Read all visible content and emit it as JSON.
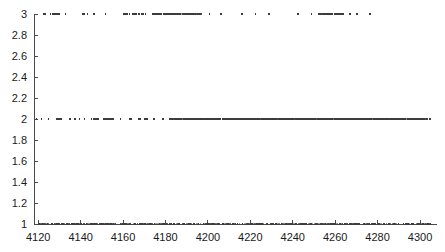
{
  "chart_data": {
    "type": "scatter",
    "title": "",
    "subtitle": "",
    "xlabel": "",
    "ylabel": "",
    "xlim": [
      4118,
      4308
    ],
    "ylim": [
      1,
      3
    ],
    "grid": false,
    "legend": null,
    "x_ticks": [
      4120,
      4140,
      4160,
      4180,
      4200,
      4220,
      4240,
      4260,
      4280,
      4300
    ],
    "x_tick_labels": [
      "4120",
      "4140",
      "4160",
      "4180",
      "4200",
      "4220",
      "4240",
      "4260",
      "4280",
      "4300"
    ],
    "y_ticks": [
      1,
      1.2,
      1.4,
      1.6,
      1.8,
      2,
      2.2,
      2.4,
      2.6,
      2.8,
      3
    ],
    "y_tick_labels": [
      "1",
      "1.2",
      "1.4",
      "1.6",
      "1.8",
      "2",
      "2.2",
      "2.4",
      "2.6",
      "2.8",
      "3"
    ],
    "marker": "dot",
    "marker_size": 1.6,
    "marker_color": "#3c3c3c",
    "axis_color": "#4a4a4a",
    "background_color": "#ffffff",
    "series": [
      {
        "name": "level-3",
        "y": 3,
        "x": [
          4122.4,
          4123.1,
          4125.8,
          4127.0,
          4127.6,
          4128.2,
          4128.9,
          4129.5,
          4130.1,
          4132.9,
          4141.0,
          4141.7,
          4143.2,
          4146.4,
          4151.8,
          4160.2,
          4161.0,
          4161.8,
          4163.1,
          4164.4,
          4165.2,
          4166.0,
          4167.5,
          4168.9,
          4169.7,
          4170.6,
          4174.2,
          4175.0,
          4175.8,
          4176.6,
          4177.4,
          4178.2,
          4179.0,
          4179.8,
          4180.6,
          4181.4,
          4182.2,
          4183.0,
          4183.8,
          4184.6,
          4185.4,
          4186.8,
          4188.0,
          4189.2,
          4190.0,
          4190.8,
          4191.6,
          4192.4,
          4193.2,
          4194.0,
          4195.2,
          4196.5,
          4200.8,
          4206.3,
          4216.1,
          4222.4,
          4228.8,
          4242.6,
          4248.9,
          4252.3,
          4253.1,
          4254.0,
          4254.8,
          4255.6,
          4256.4,
          4257.2,
          4258.0,
          4258.8,
          4259.6,
          4260.4,
          4261.2,
          4262.0,
          4262.8,
          4263.6,
          4266.9,
          4270.2,
          4276.5
        ],
        "count": 77
      },
      {
        "name": "level-2",
        "y": 2,
        "x": [
          4119.2,
          4121.5,
          4124.8,
          4128.6,
          4129.4,
          4130.2,
          4131.0,
          4134.9,
          4137.2,
          4139.5,
          4141.8,
          4145.1,
          4146.0,
          4146.8,
          4147.6,
          4148.4,
          4150.7,
          4151.5,
          4152.3,
          4153.1,
          4153.9,
          4154.7,
          4155.5,
          4158.8,
          4163.2,
          4164.0,
          4167.3,
          4168.1,
          4170.4,
          4171.2,
          4174.5,
          4178.8,
          4182.1,
          4183.0,
          4184.4,
          4185.2,
          4186.0,
          4186.8,
          4187.6,
          4188.4,
          4189.2,
          4190.0,
          4190.8,
          4191.6,
          4192.4,
          4193.2,
          4194.0,
          4194.8,
          4195.6,
          4196.4,
          4197.2,
          4198.0,
          4198.8,
          4199.6,
          4200.4,
          4201.2,
          4202.0,
          4202.8,
          4203.6,
          4204.4,
          4205.2,
          4206.0,
          4206.8,
          4207.6,
          4208.4,
          4209.2,
          4210.0,
          4210.8,
          4211.6,
          4212.4,
          4213.2,
          4214.0,
          4214.8,
          4215.6,
          4216.4,
          4217.2,
          4218.0,
          4218.8,
          4219.6,
          4220.4,
          4221.2,
          4222.0,
          4222.8,
          4223.6,
          4224.4,
          4225.2,
          4226.0,
          4226.8,
          4227.6,
          4228.4,
          4229.2,
          4230.0,
          4230.8,
          4231.6,
          4232.4,
          4233.2,
          4234.0,
          4234.8,
          4235.6,
          4236.4,
          4237.2,
          4238.0,
          4238.8,
          4239.6,
          4240.4,
          4241.2,
          4242.0,
          4242.8,
          4243.6,
          4244.4,
          4245.2,
          4246.0,
          4246.8,
          4247.6,
          4248.4,
          4249.2,
          4250.0,
          4250.8,
          4251.6,
          4252.4,
          4253.2,
          4254.0,
          4254.8,
          4255.6,
          4256.4,
          4257.2,
          4258.0,
          4258.8,
          4259.6,
          4260.4,
          4261.2,
          4262.0,
          4262.8,
          4263.6,
          4264.4,
          4265.2,
          4266.0,
          4266.8,
          4267.6,
          4268.4,
          4269.2,
          4270.0,
          4270.8,
          4271.6,
          4272.4,
          4273.2,
          4274.0,
          4274.8,
          4275.6,
          4276.4,
          4277.2,
          4278.0,
          4278.8,
          4279.6,
          4280.4,
          4281.2,
          4282.0,
          4282.8,
          4283.6,
          4284.4,
          4285.2,
          4286.0,
          4286.8,
          4287.6,
          4288.4,
          4289.2,
          4290.0,
          4290.8,
          4291.6,
          4292.4,
          4293.2,
          4294.0,
          4294.8,
          4295.6,
          4296.4,
          4297.2,
          4298.0,
          4298.8,
          4299.6,
          4300.4,
          4301.2,
          4302.0,
          4303.4,
          4304.6
        ],
        "count": 184
      },
      {
        "name": "level-1",
        "y": 1,
        "x": [
          4120.5,
          4122.0,
          4124.3,
          4126.6,
          4128.9,
          4131.2,
          4133.5,
          4135.8,
          4138.1,
          4140.4,
          4142.7,
          4145.0,
          4147.3,
          4149.6,
          4151.9,
          4154.2,
          4156.5,
          4158.8,
          4161.1,
          4163.4,
          4165.7,
          4168.0,
          4170.3,
          4172.6,
          4174.9,
          4177.2,
          4179.5,
          4181.8,
          4184.1,
          4186.4,
          4188.7,
          4191.0,
          4193.3,
          4195.6,
          4197.9,
          4200.2,
          4202.5,
          4204.8,
          4207.1,
          4209.4,
          4211.7,
          4214.0,
          4216.3,
          4218.6,
          4220.9,
          4223.2,
          4225.5,
          4227.8,
          4230.1,
          4232.4,
          4234.7,
          4237.0,
          4239.3,
          4241.6,
          4243.9,
          4246.2,
          4248.5,
          4250.8,
          4253.1,
          4255.4,
          4257.7,
          4260.0,
          4262.3,
          4264.6,
          4266.9,
          4269.2,
          4271.5,
          4273.8,
          4276.1,
          4278.4,
          4280.7,
          4283.0,
          4285.3,
          4287.6,
          4289.9,
          4292.2,
          4294.5,
          4296.8,
          4299.1,
          4301.4,
          4303.7,
          4305.0
        ],
        "count": 82
      }
    ],
    "dense_runs": [
      {
        "series": "level-3",
        "x_start": 4174.2,
        "x_end": 4196.5,
        "note": "dense cluster"
      },
      {
        "series": "level-3",
        "x_start": 4252.3,
        "x_end": 4263.6,
        "note": "dense cluster"
      },
      {
        "series": "level-2",
        "x_start": 4182.1,
        "x_end": 4302.0,
        "note": "near-continuous band"
      },
      {
        "series": "level-1",
        "x_start": 4120.0,
        "x_end": 4305.0,
        "note": "continuous baseline"
      }
    ]
  },
  "plot_geometry": {
    "left_px": 34,
    "right_px": 437,
    "top_px": 14,
    "bottom_px": 224
  }
}
